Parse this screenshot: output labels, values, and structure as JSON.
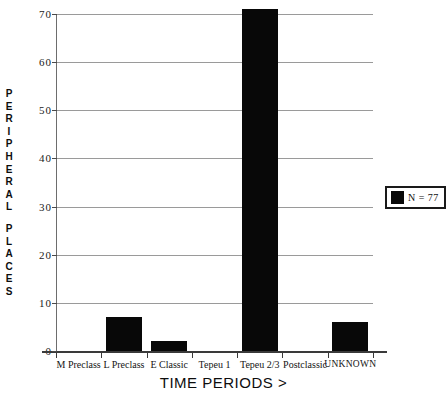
{
  "chart_data": {
    "type": "bar",
    "title": "",
    "xlabel": "TIME PERIODS >",
    "ylabel": "PERIPHERAL PLACES",
    "categories": [
      "M Preclass",
      "L Preclass",
      "E Classic",
      "Tepeu 1",
      "Tepeu 2/3",
      "Postclassic",
      "UNKNOWN"
    ],
    "values": [
      0,
      7,
      2,
      0,
      71,
      0,
      6
    ],
    "ylim": [
      0,
      70
    ],
    "ytick_labels": [
      "0",
      "10",
      "20",
      "30",
      "40",
      "50",
      "60",
      "70"
    ],
    "ytick_values": [
      0,
      10,
      20,
      30,
      40,
      50,
      60,
      70
    ],
    "grid": true,
    "legend": {
      "position": "right",
      "entries": [
        {
          "label": "N = 77",
          "color": "#080808"
        }
      ]
    },
    "series": [
      {
        "name": "N = 77",
        "color": "#080808",
        "values": [
          0,
          7,
          2,
          0,
          71,
          0,
          6
        ]
      }
    ]
  },
  "axis": {
    "y_title_letters": [
      "P",
      "E",
      "R",
      "I",
      "P",
      "H",
      "E",
      "R",
      "A",
      "L",
      " ",
      "P",
      "L",
      "A",
      "C",
      "E",
      "S"
    ]
  },
  "colors": {
    "bar": "#080808",
    "gridline": "#9a9a9a",
    "axis": "#3a3a3a",
    "text": "#141414",
    "background": "#ffffff"
  }
}
